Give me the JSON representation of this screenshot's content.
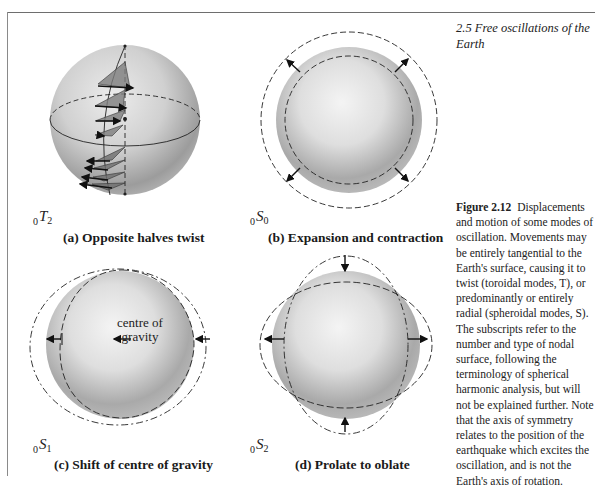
{
  "page": {
    "section_title": "2.5   Free oscillations of the Earth",
    "figure": {
      "number_label": "Figure 2.12",
      "caption_text": "Displacements and motion of some modes of oscillation. Movements may be entirely tangential to the Earth's surface, causing it to twist (toroidal modes, T), or predominantly or entirely radial (spheroidal modes, S). The subscripts refer to the number and type of nodal surface, following the terminology of spherical harmonic analysis, but will not be explained further. Note that the axis of symmetry relates to the position of the earthquake which excites the oscillation, and is not the Earth's axis of rotation."
    },
    "panels": [
      {
        "id": "a",
        "mode_prefix": "0",
        "mode_letter": "T",
        "mode_sub": "2",
        "caption": "(a) Opposite halves twist"
      },
      {
        "id": "b",
        "mode_prefix": "0",
        "mode_letter": "S",
        "mode_sub": "0",
        "caption": "(b) Expansion and contraction"
      },
      {
        "id": "c",
        "mode_prefix": "0",
        "mode_letter": "S",
        "mode_sub": "1",
        "caption": "(c) Shift of centre of gravity",
        "annotation_line1": "centre of",
        "annotation_line2": "gravity"
      },
      {
        "id": "d",
        "mode_prefix": "0",
        "mode_letter": "S",
        "mode_sub": "2",
        "caption": "(d) Prolate to oblate"
      }
    ],
    "colors": {
      "sphere_light": "#efefef",
      "sphere_mid": "#c8c8c8",
      "sphere_dark": "#8e8e8e",
      "line": "#1a1a1a",
      "triangle_fill": "#7d7d7d"
    }
  }
}
